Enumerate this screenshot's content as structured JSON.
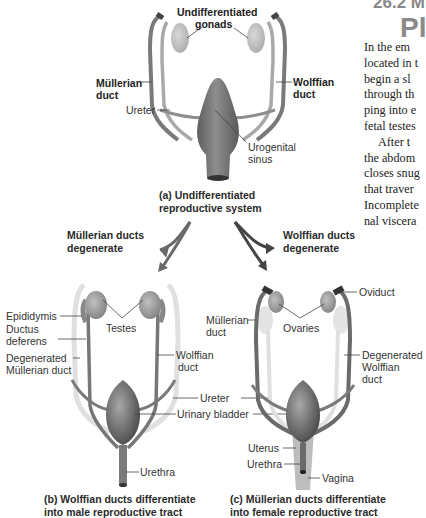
{
  "heading": {
    "number": "26.2 M",
    "word": "Pl"
  },
  "body_text": {
    "lines": [
      "In the em",
      "located in t",
      "begin a sl",
      "through th",
      "ping into e",
      "fetal testes",
      "    After t",
      "the abdom",
      "closes snug",
      "that traver",
      "Incomplete",
      "nal viscera"
    ]
  },
  "panel_a": {
    "labels": {
      "undifferentiated_gonads": "Undifferentiated\ngonads",
      "undifferentiated_line1": "Undifferentiated",
      "gonads": "gonads",
      "mullerian_duct_1": "Müllerian",
      "mullerian_duct_2": "duct",
      "wolffian_duct_1": "Wolffian",
      "wolffian_duct_2": "duct",
      "ureter": "Ureter",
      "urogenital_sinus_1": "Urogenital",
      "urogenital_sinus_2": "sinus"
    },
    "caption_line1": "(a)  Undifferentiated",
    "caption_line2": "reproductive system"
  },
  "arrows": {
    "left_line1": "Müllerian ducts",
    "left_line2": "degenerate",
    "right_line1": "Wolffian ducts",
    "right_line2": "degenerate"
  },
  "panel_b": {
    "labels": {
      "epididymis": "Epididymis",
      "ductus_deferens_1": "Ductus",
      "ductus_deferens_2": "deferens",
      "degenerated_mullerian_1": "Degenerated",
      "degenerated_mullerian_2": "Müllerian duct",
      "testes": "Testes",
      "wolffian_duct_1": "Wolffian",
      "wolffian_duct_2": "duct",
      "urethra": "Urethra"
    },
    "caption_line1": "(b)  Wolffian ducts differentiate",
    "caption_line2": "into male reproductive tract"
  },
  "shared_labels": {
    "ureter": "Ureter",
    "urinary_bladder": "Urinary bladder"
  },
  "panel_c": {
    "labels": {
      "mullerian_duct_1": "Müllerian",
      "mullerian_duct_2": "duct",
      "ovaries": "Ovaries",
      "oviduct": "Oviduct",
      "degenerated_wolffian_1": "Degenerated",
      "degenerated_wolffian_2": "Wolffian",
      "degenerated_wolffian_3": "duct",
      "uterus": "Uterus",
      "urethra": "Urethra",
      "vagina": "Vagina"
    },
    "caption_line1": "(c)  Müllerian ducts differentiate",
    "caption_line2": "into female reproductive tract"
  },
  "colors": {
    "organ_dark": "#6e6e6e",
    "organ_mid": "#9a9a9a",
    "organ_light": "#c8c8c8",
    "degenerated": "#e2e2e2",
    "leader_line": "#444444",
    "text_gray_heading": "#8a8a8a"
  }
}
